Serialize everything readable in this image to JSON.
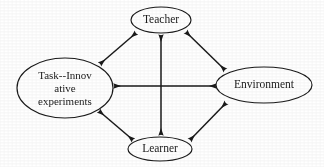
{
  "diagram": {
    "type": "node-link-diagram",
    "background_color": "#ffffff",
    "stroke_color": "#1a1a1a",
    "nodes": [
      {
        "id": "teacher",
        "label": "Teacher",
        "lines": [
          "Teacher"
        ],
        "shape": "ellipse",
        "cx": 161,
        "cy": 20,
        "rx": 30,
        "ry": 13,
        "position": "top"
      },
      {
        "id": "task",
        "label": "Task--Innovative experiments",
        "lines": [
          "Task--Innov",
          "ative",
          "experiments"
        ],
        "shape": "ellipse",
        "cx": 65,
        "cy": 88,
        "rx": 48,
        "ry": 30,
        "position": "left"
      },
      {
        "id": "environment",
        "label": "Environment",
        "lines": [
          "Environment"
        ],
        "shape": "ellipse",
        "cx": 264,
        "cy": 85,
        "rx": 48,
        "ry": 18,
        "position": "right"
      },
      {
        "id": "learner",
        "label": "Learner",
        "lines": [
          "Learner"
        ],
        "shape": "ellipse",
        "cx": 160,
        "cy": 149,
        "rx": 32,
        "ry": 12,
        "position": "bottom"
      }
    ],
    "edges": [
      {
        "id": "task-teacher",
        "from": "task",
        "to": "teacher",
        "arrow": "double",
        "x1": 100,
        "y1": 64,
        "x2": 136,
        "y2": 33
      },
      {
        "id": "teacher-environment",
        "from": "teacher",
        "to": "environment",
        "arrow": "double",
        "x1": 186,
        "y1": 32,
        "x2": 225,
        "y2": 70
      },
      {
        "id": "teacher-learner",
        "from": "teacher",
        "to": "learner",
        "arrow": "double",
        "x1": 161,
        "y1": 34,
        "x2": 161,
        "y2": 136
      },
      {
        "id": "task-environment",
        "from": "task",
        "to": "environment",
        "arrow": "double",
        "x1": 114,
        "y1": 86,
        "x2": 216,
        "y2": 86
      },
      {
        "id": "task-learner",
        "from": "task",
        "to": "learner",
        "arrow": "double",
        "x1": 99,
        "y1": 111,
        "x2": 133,
        "y2": 140
      },
      {
        "id": "learner-environment",
        "from": "learner",
        "to": "environment",
        "arrow": "double",
        "x1": 190,
        "y1": 140,
        "x2": 226,
        "y2": 103
      }
    ]
  }
}
